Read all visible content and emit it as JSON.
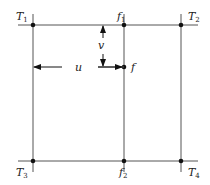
{
  "diagram": {
    "type": "bilinear-interpolation-grid",
    "points": {
      "T1": {
        "base": "T",
        "sub": "1"
      },
      "T2": {
        "base": "T",
        "sub": "2"
      },
      "T3": {
        "base": "T",
        "sub": "3"
      },
      "T4": {
        "base": "T",
        "sub": "4"
      },
      "f1": {
        "base": "f",
        "sub": "1"
      },
      "f2": {
        "base": "f",
        "sub": "2"
      },
      "f": {
        "base": "f",
        "sub": ""
      }
    },
    "dimensions": {
      "u": "u",
      "v": "v"
    },
    "colors": {
      "line": "#555555",
      "dot": "#111111",
      "text": "#222222"
    }
  }
}
